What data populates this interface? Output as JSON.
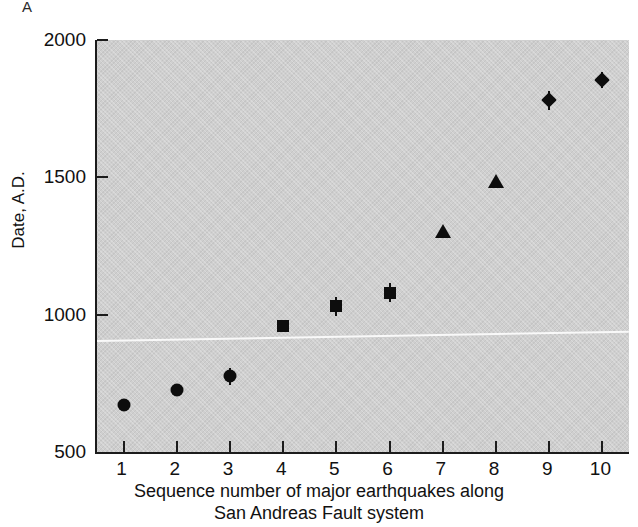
{
  "figure": {
    "panel_label": "A",
    "y_axis_title": "Date, A.D.",
    "x_axis_caption_line1": "Sequence number of major earthquakes along",
    "x_axis_caption_line2": "San Andreas Fault system",
    "plot_background_color": "#cfcfcf",
    "marker_color": "#0d0d0d",
    "axis_color": "#1c1c1c"
  },
  "chart_data": {
    "type": "scatter",
    "title": "",
    "subtitle": "",
    "xlabel": "Sequence number of major earthquakes along San Andreas Fault system",
    "ylabel": "Date, A.D.",
    "xlim": [
      0.5,
      10.5
    ],
    "ylim": [
      500,
      2000
    ],
    "x_ticks": [
      1,
      2,
      3,
      4,
      5,
      6,
      7,
      8,
      9,
      10
    ],
    "x_tick_labels": [
      "1",
      "2",
      "3",
      "4",
      "5",
      "6",
      "7",
      "8",
      "9",
      "10"
    ],
    "y_ticks": [
      500,
      1000,
      1500,
      2000
    ],
    "y_tick_labels": [
      "500",
      "1000",
      "1500",
      "2000"
    ],
    "grid": false,
    "legend": false,
    "legend_position": "none",
    "x": [
      1,
      2,
      3,
      4,
      5,
      6,
      7,
      8,
      9,
      10
    ],
    "values": [
      670,
      725,
      775,
      960,
      1030,
      1080,
      1305,
      1485,
      1780,
      1855
    ],
    "markers": [
      "circle",
      "circle",
      "circle",
      "square",
      "square",
      "square",
      "triangle",
      "triangle",
      "diamond",
      "diamond"
    ],
    "error_low": [
      0,
      0,
      30,
      0,
      35,
      35,
      0,
      0,
      35,
      30
    ],
    "error_high": [
      0,
      0,
      30,
      0,
      35,
      35,
      0,
      0,
      35,
      30
    ],
    "points": [
      {
        "seq": 1,
        "date": 670,
        "marker": "circle",
        "err": 0
      },
      {
        "seq": 2,
        "date": 725,
        "marker": "circle",
        "err": 0
      },
      {
        "seq": 3,
        "date": 775,
        "marker": "circle",
        "err": 30
      },
      {
        "seq": 4,
        "date": 960,
        "marker": "square",
        "err": 0
      },
      {
        "seq": 5,
        "date": 1030,
        "marker": "square",
        "err": 35
      },
      {
        "seq": 6,
        "date": 1080,
        "marker": "square",
        "err": 35
      },
      {
        "seq": 7,
        "date": 1305,
        "marker": "triangle",
        "err": 0
      },
      {
        "seq": 8,
        "date": 1485,
        "marker": "triangle",
        "err": 0
      },
      {
        "seq": 9,
        "date": 1780,
        "marker": "diamond",
        "err": 35
      },
      {
        "seq": 10,
        "date": 1855,
        "marker": "diamond",
        "err": 30
      }
    ]
  }
}
